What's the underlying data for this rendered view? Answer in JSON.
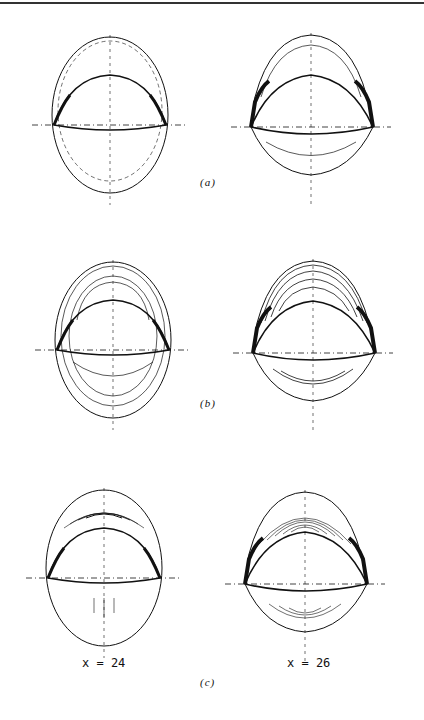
{
  "figure": {
    "panels": [
      {
        "id": "a",
        "label": "(a)",
        "description": "Contour plots of two cross-sections with sparse contour lines"
      },
      {
        "id": "b",
        "label": "(b)",
        "description": "Contour plots of two cross-sections with concentric contour lines"
      },
      {
        "id": "c",
        "label": "(c)",
        "description": "Contour plots of two cross-sections with dense contour lines"
      }
    ],
    "columns": [
      {
        "label": "x = 24"
      },
      {
        "label": "x = 26"
      }
    ],
    "colors": {
      "line": "#111111",
      "background": "#ffffff"
    }
  }
}
